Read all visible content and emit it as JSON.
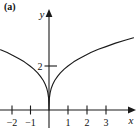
{
  "figure": {
    "panel_label": "(a)",
    "background_color": "#ffffff",
    "ink_color": "#1a1a1a"
  },
  "axes": {
    "x_axis_label": "x",
    "y_axis_label": "y"
  },
  "chart_data": {
    "type": "line",
    "title": "",
    "subtitle": "",
    "xlabel": "x",
    "ylabel": "y",
    "xlim": [
      -2.55,
      4.45
    ],
    "ylim": [
      -0.85,
      4.45
    ],
    "grid": false,
    "legend": false,
    "legend_position": "none",
    "x_ticks": [
      -2,
      -1,
      1,
      2,
      3
    ],
    "x_tick_labels": [
      "−2",
      "−1",
      "1",
      "2",
      "3"
    ],
    "y_ticks": [
      2
    ],
    "y_tick_labels": [
      "2"
    ],
    "annotations": [
      "cusp at origin",
      "curve symmetric about the y-axis"
    ],
    "series": [
      {
        "name": "y = 2|x|^(1/3)",
        "x": [
          -2.55,
          -2.2,
          -1.9,
          -1.6,
          -1.3,
          -1.0,
          -0.8,
          -0.6,
          -0.45,
          -0.3,
          -0.2,
          -0.12,
          -0.06,
          -0.02,
          0.0,
          0.02,
          0.06,
          0.12,
          0.2,
          0.3,
          0.45,
          0.6,
          0.8,
          1.0,
          1.3,
          1.6,
          1.9,
          2.2,
          2.6,
          3.0,
          3.5,
          4.0,
          4.45
        ],
        "y": [
          2.74,
          2.61,
          2.48,
          2.34,
          2.19,
          2.0,
          1.86,
          1.69,
          1.53,
          1.34,
          1.17,
          0.99,
          0.78,
          0.54,
          0.0,
          0.54,
          0.78,
          0.99,
          1.17,
          1.34,
          1.53,
          1.69,
          1.86,
          2.0,
          2.19,
          2.34,
          2.48,
          2.61,
          2.76,
          2.88,
          3.04,
          3.17,
          3.28
        ]
      }
    ]
  }
}
